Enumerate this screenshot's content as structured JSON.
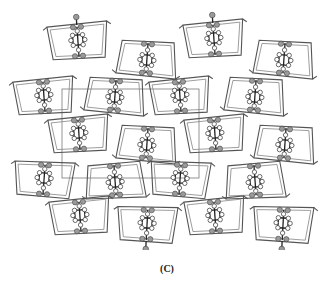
{
  "figure": {
    "caption": "(C)",
    "unit_cell": {
      "x": 62,
      "y": 89,
      "w": 137,
      "h": 89
    },
    "colors": {
      "background": "#ffffff",
      "frame": "#555555",
      "heteroatom": "#9a9a9a",
      "carbon": "#ffffff",
      "bond": "#222222"
    },
    "molecules": [
      {
        "cx": 78,
        "cy": 42,
        "rot": -4,
        "flip": false,
        "pendant": "top"
      },
      {
        "cx": 214,
        "cy": 40,
        "rot": -4,
        "flip": false,
        "pendant": "top"
      },
      {
        "cx": 147,
        "cy": 58,
        "rot": 4,
        "flip": true,
        "pendant": "none"
      },
      {
        "cx": 284,
        "cy": 58,
        "rot": 4,
        "flip": true,
        "pendant": "none"
      },
      {
        "cx": 44,
        "cy": 97,
        "rot": -4,
        "flip": false,
        "pendant": "none"
      },
      {
        "cx": 115,
        "cy": 95,
        "rot": 4,
        "flip": true,
        "pendant": "none"
      },
      {
        "cx": 180,
        "cy": 97,
        "rot": -4,
        "flip": false,
        "pendant": "none"
      },
      {
        "cx": 255,
        "cy": 95,
        "rot": 4,
        "flip": true,
        "pendant": "none"
      },
      {
        "cx": 79,
        "cy": 135,
        "rot": -4,
        "flip": false,
        "pendant": "none"
      },
      {
        "cx": 147,
        "cy": 143,
        "rot": 4,
        "flip": true,
        "pendant": "none"
      },
      {
        "cx": 215,
        "cy": 135,
        "rot": -4,
        "flip": false,
        "pendant": "none"
      },
      {
        "cx": 285,
        "cy": 143,
        "rot": 4,
        "flip": true,
        "pendant": "none"
      },
      {
        "cx": 44,
        "cy": 180,
        "rot": 4,
        "flip": false,
        "pendant": "none"
      },
      {
        "cx": 115,
        "cy": 180,
        "rot": -4,
        "flip": true,
        "pendant": "none"
      },
      {
        "cx": 180,
        "cy": 180,
        "rot": 4,
        "flip": false,
        "pendant": "none"
      },
      {
        "cx": 255,
        "cy": 180,
        "rot": -4,
        "flip": true,
        "pendant": "none"
      },
      {
        "cx": 80,
        "cy": 217,
        "rot": -4,
        "flip": false,
        "pendant": "none"
      },
      {
        "cx": 147,
        "cy": 225,
        "rot": 3,
        "flip": false,
        "pendant": "bottom"
      },
      {
        "cx": 215,
        "cy": 217,
        "rot": -4,
        "flip": false,
        "pendant": "none"
      },
      {
        "cx": 283,
        "cy": 225,
        "rot": 3,
        "flip": false,
        "pendant": "bottom"
      }
    ]
  }
}
